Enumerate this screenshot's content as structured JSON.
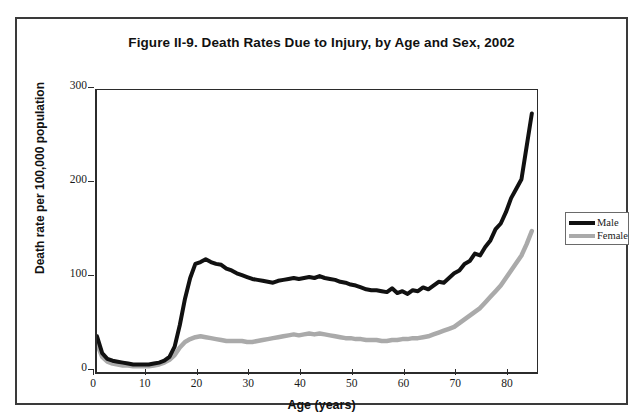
{
  "figure": {
    "title": "Figure II-9. Death Rates Due to Injury, by Age and Sex, 2002"
  },
  "axes": {
    "y_title": "Death rate per 100,000 population",
    "x_title": "Age (years)",
    "y_ticks": [
      "0",
      "100",
      "200",
      "300"
    ],
    "x_ticks": [
      "0",
      "10",
      "20",
      "30",
      "40",
      "50",
      "60",
      "70",
      "80"
    ]
  },
  "legend": {
    "items": [
      {
        "label": "Male",
        "color": "#111111"
      },
      {
        "label": "Female",
        "color": "#aaaaaa"
      }
    ]
  },
  "chart_data": {
    "type": "line",
    "title": "Figure II-9. Death Rates Due to Injury, by Age and Sex, 2002",
    "xlabel": "Age (years)",
    "ylabel": "Death rate per 100,000 population",
    "xlim": [
      0,
      85
    ],
    "ylim": [
      0,
      300
    ],
    "yticks": [
      0,
      100,
      200,
      300
    ],
    "xticks": [
      0,
      10,
      20,
      30,
      40,
      50,
      60,
      70,
      80
    ],
    "grid": false,
    "legend_position": "right-outside",
    "x": [
      0,
      1,
      2,
      3,
      4,
      5,
      6,
      7,
      8,
      9,
      10,
      11,
      12,
      13,
      14,
      15,
      16,
      17,
      18,
      19,
      20,
      21,
      22,
      23,
      24,
      25,
      26,
      27,
      28,
      29,
      30,
      31,
      32,
      33,
      34,
      35,
      36,
      37,
      38,
      39,
      40,
      41,
      42,
      43,
      44,
      45,
      46,
      47,
      48,
      49,
      50,
      51,
      52,
      53,
      54,
      55,
      56,
      57,
      58,
      59,
      60,
      61,
      62,
      63,
      64,
      65,
      66,
      67,
      68,
      69,
      70,
      71,
      72,
      73,
      74,
      75,
      76,
      77,
      78,
      79,
      80,
      81,
      82,
      83,
      84
    ],
    "series": [
      {
        "name": "Male",
        "color": "#111111",
        "values": [
          38,
          20,
          14,
          12,
          11,
          10,
          9,
          8,
          8,
          8,
          8,
          9,
          10,
          12,
          16,
          27,
          50,
          78,
          100,
          115,
          117,
          120,
          117,
          115,
          114,
          110,
          108,
          105,
          103,
          101,
          99,
          98,
          97,
          96,
          95,
          97,
          98,
          99,
          100,
          99,
          100,
          101,
          100,
          102,
          100,
          99,
          98,
          96,
          95,
          93,
          92,
          90,
          88,
          87,
          87,
          86,
          85,
          89,
          84,
          86,
          83,
          87,
          86,
          90,
          88,
          92,
          96,
          95,
          100,
          105,
          108,
          115,
          118,
          126,
          124,
          133,
          140,
          152,
          158,
          170,
          185,
          195,
          205,
          240,
          275
        ]
      },
      {
        "name": "Female",
        "color": "#aaaaaa",
        "values": [
          30,
          16,
          11,
          9,
          8,
          7,
          7,
          6,
          6,
          6,
          6,
          7,
          8,
          10,
          13,
          18,
          26,
          32,
          35,
          37,
          38,
          37,
          36,
          35,
          34,
          33,
          33,
          33,
          33,
          32,
          32,
          33,
          34,
          35,
          36,
          37,
          38,
          39,
          40,
          39,
          40,
          41,
          40,
          41,
          40,
          39,
          38,
          37,
          36,
          36,
          35,
          35,
          34,
          34,
          34,
          33,
          33,
          34,
          34,
          35,
          35,
          36,
          36,
          37,
          38,
          40,
          42,
          44,
          46,
          48,
          52,
          56,
          60,
          64,
          68,
          74,
          80,
          86,
          92,
          100,
          108,
          116,
          124,
          136,
          150
        ]
      }
    ]
  }
}
